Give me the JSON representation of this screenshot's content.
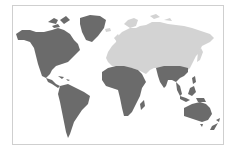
{
  "map": {
    "type": "world-map",
    "colors": {
      "highlighted": "#6b6b6b",
      "base": "#d3d3d3",
      "background": "#ffffff",
      "border": "#cfcfcf"
    },
    "regions": [
      {
        "name": "North America",
        "state": "highlighted"
      },
      {
        "name": "Greenland",
        "state": "highlighted"
      },
      {
        "name": "Central America & Caribbean",
        "state": "highlighted"
      },
      {
        "name": "South America",
        "state": "highlighted"
      },
      {
        "name": "Africa",
        "state": "highlighted"
      },
      {
        "name": "Madagascar",
        "state": "highlighted"
      },
      {
        "name": "South Asia",
        "state": "highlighted"
      },
      {
        "name": "Southeast Asia",
        "state": "highlighted"
      },
      {
        "name": "Maritime Southeast Asia",
        "state": "highlighted"
      },
      {
        "name": "Australia",
        "state": "highlighted"
      },
      {
        "name": "New Zealand",
        "state": "highlighted"
      },
      {
        "name": "Europe",
        "state": "base"
      },
      {
        "name": "Russia & Central Asia",
        "state": "base"
      },
      {
        "name": "Middle East",
        "state": "base"
      },
      {
        "name": "East Asia",
        "state": "base"
      }
    ]
  }
}
